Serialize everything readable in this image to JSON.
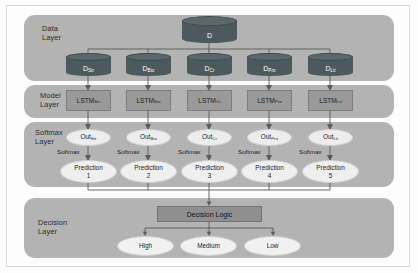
{
  "diagram": {
    "colors": {
      "band": "#b3b3b3",
      "cylinder": "#4c5a5e",
      "model_box": "#9a9a9a",
      "ellipse": "#ededed",
      "decision_logic_box": "#8f8f8f",
      "wire": "#5a5a5a",
      "page_background": "#fcfcfc"
    }
  },
  "layers": [
    {
      "id": "data",
      "label": "Data\nLayer"
    },
    {
      "id": "model",
      "label": "Model\nLayer"
    },
    {
      "id": "softmax",
      "label": "Softmax\nLayer"
    },
    {
      "id": "decision",
      "label": "Decision\nLayer"
    }
  ],
  "data_layer": {
    "root": {
      "label": "D",
      "sub": ""
    },
    "shards": [
      {
        "label": "D",
        "sub": "Str"
      },
      {
        "label": "D",
        "sub": "Bio"
      },
      {
        "label": "D",
        "sub": "Cr"
      },
      {
        "label": "D",
        "sub": "Pro"
      },
      {
        "label": "D",
        "sub": "Lit"
      }
    ]
  },
  "model_layer": {
    "models": [
      {
        "label": "LSTM",
        "sub": "Str"
      },
      {
        "label": "LSTM",
        "sub": "Bio"
      },
      {
        "label": "LSTM",
        "sub": "Cr"
      },
      {
        "label": "LSTM",
        "sub": "Pro"
      },
      {
        "label": "LSTM",
        "sub": "Lit"
      }
    ]
  },
  "softmax_layer": {
    "outputs": [
      {
        "label": "Out",
        "sub": "Str"
      },
      {
        "label": "Out",
        "sub": "Bio"
      },
      {
        "label": "Out",
        "sub": "Cr"
      },
      {
        "label": "Out",
        "sub": "Pro"
      },
      {
        "label": "Out",
        "sub": "Lit"
      }
    ],
    "softmax_label": "Softmax",
    "predictions": [
      {
        "label": "Prediction",
        "index": "1"
      },
      {
        "label": "Prediction",
        "index": "2"
      },
      {
        "label": "Prediction",
        "index": "3"
      },
      {
        "label": "Prediction",
        "index": "4"
      },
      {
        "label": "Prediction",
        "index": "5"
      }
    ]
  },
  "decision_layer": {
    "logic_box": "Decision Logic",
    "outcomes": [
      {
        "label": "High"
      },
      {
        "label": "Medium"
      },
      {
        "label": "Low"
      }
    ]
  }
}
